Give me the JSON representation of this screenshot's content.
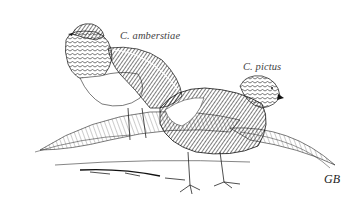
{
  "illustration": {
    "subject": "Two pheasants, pen-and-ink drawing",
    "labels": {
      "left_bird": "C. amberstiae",
      "right_bird": "C. pictus"
    },
    "signature": "GB",
    "colors": {
      "background": "#ffffff",
      "ink": "#111111",
      "label_text": "#444444"
    }
  }
}
